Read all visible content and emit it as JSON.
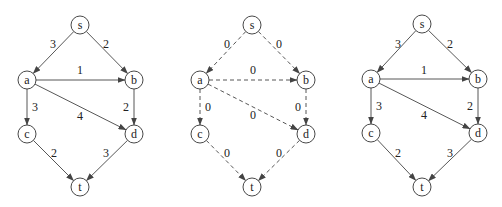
{
  "diagram": {
    "type": "flow-network",
    "node_radius": 9,
    "panels": [
      {
        "id": "original-network",
        "dashed": false,
        "nodes": [
          {
            "id": "s",
            "label": "s",
            "x": 80,
            "y": 25
          },
          {
            "id": "a",
            "label": "a",
            "x": 27,
            "y": 80
          },
          {
            "id": "b",
            "label": "b",
            "x": 134,
            "y": 80
          },
          {
            "id": "c",
            "label": "c",
            "x": 27,
            "y": 134
          },
          {
            "id": "d",
            "label": "d",
            "x": 134,
            "y": 134
          },
          {
            "id": "t",
            "label": "t",
            "x": 80,
            "y": 187
          }
        ],
        "edges": [
          {
            "from": "s",
            "to": "a",
            "label": "3",
            "lx": 53,
            "ly": 44
          },
          {
            "from": "s",
            "to": "b",
            "label": "2",
            "lx": 106,
            "ly": 44
          },
          {
            "from": "a",
            "to": "b",
            "label": "1",
            "lx": 80,
            "ly": 70
          },
          {
            "from": "a",
            "to": "c",
            "label": "3",
            "lx": 35,
            "ly": 107
          },
          {
            "from": "a",
            "to": "d",
            "label": "4",
            "lx": 80,
            "ly": 116
          },
          {
            "from": "b",
            "to": "d",
            "label": "2",
            "lx": 126,
            "ly": 107
          },
          {
            "from": "c",
            "to": "t",
            "label": "2",
            "lx": 54,
            "ly": 153
          },
          {
            "from": "d",
            "to": "t",
            "label": "3",
            "lx": 106,
            "ly": 153
          }
        ]
      },
      {
        "id": "zero-flow-network",
        "dashed": true,
        "nodes": [
          {
            "id": "s",
            "label": "s",
            "x": 252,
            "y": 25
          },
          {
            "id": "a",
            "label": "a",
            "x": 200,
            "y": 80
          },
          {
            "id": "b",
            "label": "b",
            "x": 306,
            "y": 80
          },
          {
            "id": "c",
            "label": "c",
            "x": 200,
            "y": 134
          },
          {
            "id": "d",
            "label": "d",
            "x": 306,
            "y": 134
          },
          {
            "id": "t",
            "label": "t",
            "x": 252,
            "y": 187
          }
        ],
        "edges": [
          {
            "from": "s",
            "to": "a",
            "label": "0",
            "lx": 227,
            "ly": 44
          },
          {
            "from": "s",
            "to": "b",
            "label": "0",
            "lx": 279,
            "ly": 44
          },
          {
            "from": "a",
            "to": "b",
            "label": "0",
            "lx": 253,
            "ly": 70
          },
          {
            "from": "a",
            "to": "c",
            "label": "0",
            "lx": 208,
            "ly": 107
          },
          {
            "from": "a",
            "to": "d",
            "label": "0",
            "lx": 253,
            "ly": 115
          },
          {
            "from": "b",
            "to": "d",
            "label": "0",
            "lx": 298,
            "ly": 107
          },
          {
            "from": "c",
            "to": "t",
            "label": "0",
            "lx": 227,
            "ly": 153
          },
          {
            "from": "d",
            "to": "t",
            "label": "0",
            "lx": 279,
            "ly": 153
          }
        ]
      },
      {
        "id": "residual-network",
        "dashed": false,
        "nodes": [
          {
            "id": "s",
            "label": "s",
            "x": 422,
            "y": 24
          },
          {
            "id": "a",
            "label": "a",
            "x": 371,
            "y": 79
          },
          {
            "id": "b",
            "label": "b",
            "x": 478,
            "y": 79
          },
          {
            "id": "c",
            "label": "c",
            "x": 371,
            "y": 133
          },
          {
            "id": "d",
            "label": "d",
            "x": 478,
            "y": 133
          },
          {
            "id": "t",
            "label": "t",
            "x": 422,
            "y": 187
          }
        ],
        "edges": [
          {
            "from": "s",
            "to": "a",
            "label": "3",
            "lx": 398,
            "ly": 44
          },
          {
            "from": "s",
            "to": "b",
            "label": "2",
            "lx": 450,
            "ly": 44
          },
          {
            "from": "a",
            "to": "b",
            "label": "1",
            "lx": 424,
            "ly": 70
          },
          {
            "from": "a",
            "to": "c",
            "label": "3",
            "lx": 379,
            "ly": 106
          },
          {
            "from": "a",
            "to": "d",
            "label": "4",
            "lx": 424,
            "ly": 115
          },
          {
            "from": "b",
            "to": "d",
            "label": "2",
            "lx": 470,
            "ly": 106
          },
          {
            "from": "c",
            "to": "t",
            "label": "2",
            "lx": 398,
            "ly": 153
          },
          {
            "from": "d",
            "to": "t",
            "label": "3",
            "lx": 450,
            "ly": 153
          }
        ]
      }
    ]
  }
}
